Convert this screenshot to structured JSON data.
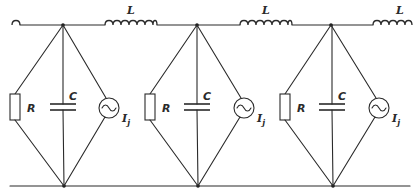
{
  "diagram": {
    "type": "circuit-schematic",
    "colors": {
      "line": "#2a2a2a",
      "background": "#ffffff"
    },
    "top_rail_y": 25,
    "bottom_rail_y": 186,
    "inductors": [
      {
        "id": "L-left-stub",
        "label": "",
        "x1": 12,
        "x2": 22
      },
      {
        "id": "L1",
        "label": "L",
        "x1": 105,
        "x2": 157
      },
      {
        "id": "L2",
        "label": "L",
        "x1": 240,
        "x2": 292
      },
      {
        "id": "L3",
        "label": "L",
        "x1": 373,
        "x2": 412
      }
    ],
    "cells": [
      {
        "index": 1,
        "top_node_x": 63,
        "bottom_node_x": 64,
        "resistor": {
          "label": "R",
          "x": 15
        },
        "capacitor": {
          "label": "C",
          "x": 63
        },
        "source": {
          "label": "I",
          "subscript": "j",
          "x": 109
        }
      },
      {
        "index": 2,
        "top_node_x": 197,
        "bottom_node_x": 198,
        "resistor": {
          "label": "R",
          "x": 150
        },
        "capacitor": {
          "label": "C",
          "x": 197
        },
        "source": {
          "label": "I",
          "subscript": "j",
          "x": 244
        }
      },
      {
        "index": 3,
        "top_node_x": 331,
        "bottom_node_x": 333,
        "resistor": {
          "label": "R",
          "x": 285
        },
        "capacitor": {
          "label": "C",
          "x": 332
        },
        "source": {
          "label": "I",
          "subscript": "j",
          "x": 379
        }
      }
    ]
  },
  "labels": {
    "L1": "L",
    "L2": "L",
    "L3": "L",
    "R1": "R",
    "R2": "R",
    "R3": "R",
    "C1": "C",
    "C2": "C",
    "C3": "C",
    "I1": "I",
    "I2": "I",
    "I3": "I",
    "j1": "j",
    "j2": "j",
    "j3": "j"
  }
}
